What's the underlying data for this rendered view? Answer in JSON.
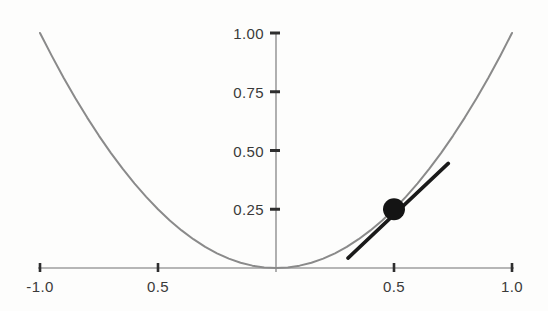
{
  "chart_data": {
    "type": "line",
    "title": "",
    "subtitle": "",
    "xlabel": "",
    "ylabel": "",
    "xlim": [
      -1.0,
      1.0
    ],
    "ylim": [
      0.0,
      1.0
    ],
    "grid": false,
    "legend": null,
    "x_ticks": [
      {
        "value": -1.0,
        "label": "-1.0"
      },
      {
        "value": -0.5,
        "label": "0.5"
      },
      {
        "value": 0.5,
        "label": "0.5"
      },
      {
        "value": 1.0,
        "label": "1.0"
      }
    ],
    "y_ticks": [
      {
        "value": 0.25,
        "label": "0.25"
      },
      {
        "value": 0.5,
        "label": "0.50"
      },
      {
        "value": 0.75,
        "label": "0.75"
      },
      {
        "value": 1.0,
        "label": "1.00"
      }
    ],
    "series": [
      {
        "name": "parabola",
        "function": "y = x^2",
        "color": "#8a8a8a",
        "width": 2.0,
        "x": [
          -1.0,
          -0.95,
          -0.9,
          -0.85,
          -0.8,
          -0.75,
          -0.7,
          -0.65,
          -0.6,
          -0.55,
          -0.5,
          -0.45,
          -0.4,
          -0.35,
          -0.3,
          -0.25,
          -0.2,
          -0.15,
          -0.1,
          -0.05,
          0.0,
          0.05,
          0.1,
          0.15,
          0.2,
          0.25,
          0.3,
          0.35,
          0.4,
          0.45,
          0.5,
          0.55,
          0.6,
          0.65,
          0.7,
          0.75,
          0.8,
          0.85,
          0.9,
          0.95,
          1.0
        ],
        "y": [
          1.0,
          0.9025,
          0.81,
          0.7225,
          0.64,
          0.5625,
          0.49,
          0.4225,
          0.36,
          0.3025,
          0.25,
          0.2025,
          0.16,
          0.1225,
          0.09,
          0.0625,
          0.04,
          0.0225,
          0.01,
          0.0025,
          0.0,
          0.0025,
          0.01,
          0.0225,
          0.04,
          0.0625,
          0.09,
          0.1225,
          0.16,
          0.2025,
          0.25,
          0.3025,
          0.36,
          0.4225,
          0.49,
          0.5625,
          0.64,
          0.7225,
          0.81,
          0.9025,
          1.0
        ]
      },
      {
        "name": "tangent-line",
        "function": "y = x - 0.25",
        "color": "#1a1a1a",
        "width": 3.6,
        "x": [
          0.305,
          0.73
        ],
        "y": [
          0.042,
          0.445
        ]
      }
    ],
    "markers": [
      {
        "name": "tangent-point",
        "x": 0.5,
        "y": 0.25,
        "shape": "circle",
        "color": "#141414",
        "radius_px": 11
      }
    ],
    "axes": {
      "x_axis_color": "#707070",
      "y_axis_color": "#707070",
      "tick_color": "#2e2e2e",
      "x_axis_at_y": 0.0,
      "y_axis_at_x": 0.0
    },
    "background_color": "#fdfdfc"
  }
}
